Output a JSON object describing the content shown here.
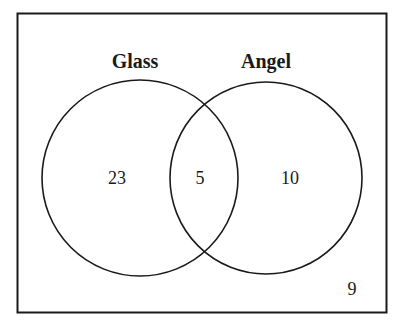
{
  "diagram": {
    "type": "venn",
    "sets": [
      {
        "name": "Glass",
        "only_count": "23"
      },
      {
        "name": "Angel",
        "only_count": "10"
      }
    ],
    "intersection_count": "5",
    "outside_count": "9"
  },
  "colors": {
    "stroke": "#1a1a1a",
    "background": "#ffffff"
  }
}
